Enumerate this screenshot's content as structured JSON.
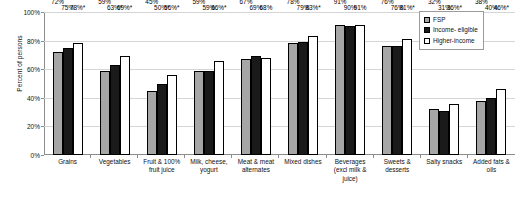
{
  "chart_data": {
    "type": "bar",
    "title": "",
    "xlabel": "",
    "ylabel": "Percent of persons",
    "ylim": [
      0,
      100
    ],
    "ytick_labels": [
      "0%",
      "20%",
      "40%",
      "60%",
      "80%",
      "100%"
    ],
    "ytick_values": [
      0,
      20,
      40,
      60,
      80,
      100
    ],
    "grid": true,
    "legend_position": "top-right",
    "categories": [
      "Grains",
      "Vegetables",
      "Fruit & 100% fruit juice",
      "Milk, cheese, yogurt",
      "Meat & meat alternates",
      "Mixed dishes",
      "Beverages (excl milk & juice)",
      "Sweets & desserts",
      "Salty snacks",
      "Added fats & oils"
    ],
    "series": [
      {
        "name": "FSP",
        "color": "#a6a6a6",
        "values": [
          72,
          59,
          45,
          59,
          67,
          78,
          91,
          76,
          32,
          38
        ],
        "labels": [
          "72%",
          "59%",
          "45%",
          "59%",
          "67%",
          "78%",
          "91%",
          "76%",
          "32%",
          "38%"
        ]
      },
      {
        "name": "Income- eligible",
        "color": "#1a1a1a",
        "values": [
          75,
          63,
          50,
          59,
          69,
          79,
          90,
          76,
          31,
          40
        ],
        "labels": [
          "75%",
          "63%*",
          "50%*",
          "59%",
          "69%",
          "79%",
          "90%",
          "76%",
          "31%",
          "40%"
        ]
      },
      {
        "name": "Higher-income",
        "color": "#ffffff",
        "values": [
          78,
          69,
          56,
          66,
          68,
          83,
          91,
          81,
          36,
          46
        ],
        "labels": [
          "78%*",
          "69%*",
          "56%*",
          "66%*",
          "68%",
          "83%*",
          "91%",
          "81%*",
          "36%*",
          "46%*"
        ]
      }
    ],
    "annotation_note": "* denotes statistically significant difference"
  },
  "legend": {
    "items": [
      {
        "label": "FSP"
      },
      {
        "label": "Income- eligible"
      },
      {
        "label": "Higher-income"
      }
    ]
  }
}
